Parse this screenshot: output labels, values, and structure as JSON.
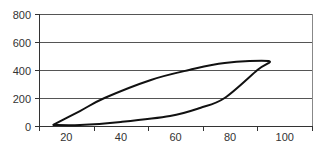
{
  "chart_data": {
    "type": "scatter",
    "title": "",
    "xlabel": "",
    "ylabel": "",
    "xlim": [
      10,
      110
    ],
    "ylim": [
      0,
      800
    ],
    "grid": {
      "horizontal": true,
      "vertical": false
    },
    "legend": null,
    "x_tick_labels": [
      "20",
      "40",
      "60",
      "80",
      "100"
    ],
    "y_tick_labels": [
      "0",
      "200",
      "400",
      "600",
      "800"
    ],
    "series": [
      {
        "name": "loop",
        "smooth": true,
        "color": "#111111",
        "points": [
          [
            15,
            7
          ],
          [
            25,
            107
          ],
          [
            34,
            200
          ],
          [
            51,
            329
          ],
          [
            65,
            400
          ],
          [
            78,
            450
          ],
          [
            94,
            464
          ],
          [
            90,
            400
          ],
          [
            78,
            200
          ],
          [
            69,
            129
          ],
          [
            58,
            71
          ],
          [
            40,
            29
          ],
          [
            25,
            7
          ],
          [
            15,
            7
          ]
        ]
      }
    ]
  },
  "colors": {
    "axis": "#333333",
    "grid": "#555555",
    "line": "#111111",
    "background": "#ffffff"
  }
}
